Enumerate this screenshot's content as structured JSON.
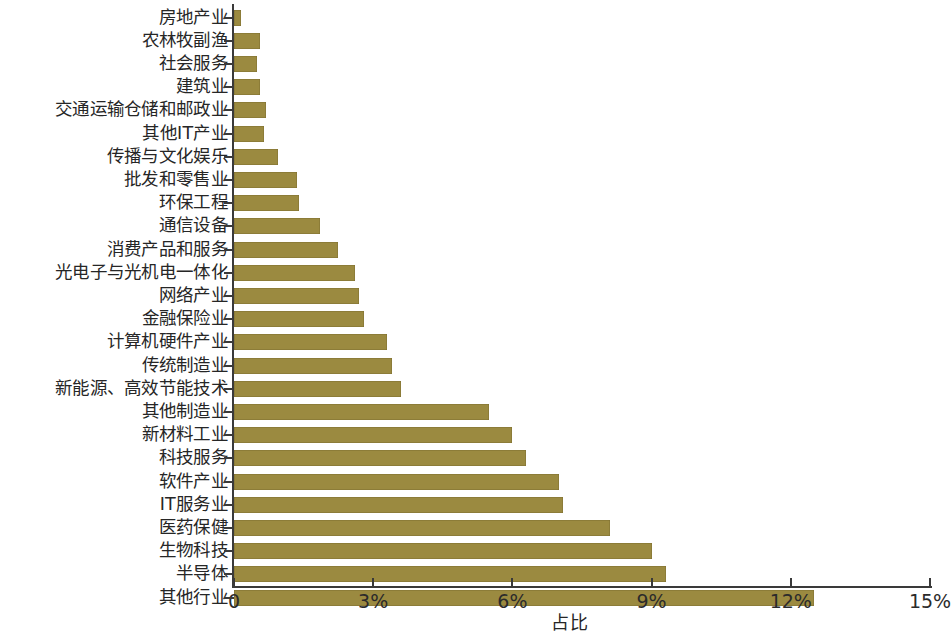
{
  "chart_data": {
    "type": "bar",
    "orientation": "horizontal",
    "title": "",
    "xlabel": "占比",
    "ylabel": "",
    "xlim": [
      0,
      15
    ],
    "xunit": "%",
    "grid": false,
    "legend": null,
    "bar_color": "#9b8a40",
    "axis_color": "#3a3a3a",
    "xticks": [
      {
        "value": 0,
        "label": "0"
      },
      {
        "value": 3,
        "label": "3%"
      },
      {
        "value": 6,
        "label": "6%"
      },
      {
        "value": 9,
        "label": "9%"
      },
      {
        "value": 12,
        "label": "12%"
      },
      {
        "value": 15,
        "label": "15%"
      }
    ],
    "categories": [
      "房地产业",
      "农林牧副渔",
      "社会服务",
      "建筑业",
      "交通运输仓储和邮政业",
      "其他IT产业",
      "传播与文化娱乐",
      "批发和零售业",
      "环保工程",
      "通信设备",
      "消费产品和服务",
      "光电子与光机电一体化",
      "网络产业",
      "金融保险业",
      "计算机硬件产业",
      "传统制造业",
      "新能源、高效节能技术",
      "其他制造业",
      "新材料工业",
      "科技服务",
      "软件产业",
      "IT服务业",
      "医药保健",
      "生物科技",
      "半导体",
      "其他行业"
    ],
    "values": [
      0.15,
      0.55,
      0.5,
      0.55,
      0.7,
      0.65,
      0.95,
      1.35,
      1.4,
      1.85,
      2.25,
      2.6,
      2.7,
      2.8,
      3.3,
      3.4,
      3.6,
      5.5,
      6.0,
      6.3,
      7.0,
      7.1,
      8.1,
      9.0,
      9.3,
      12.5
    ]
  }
}
